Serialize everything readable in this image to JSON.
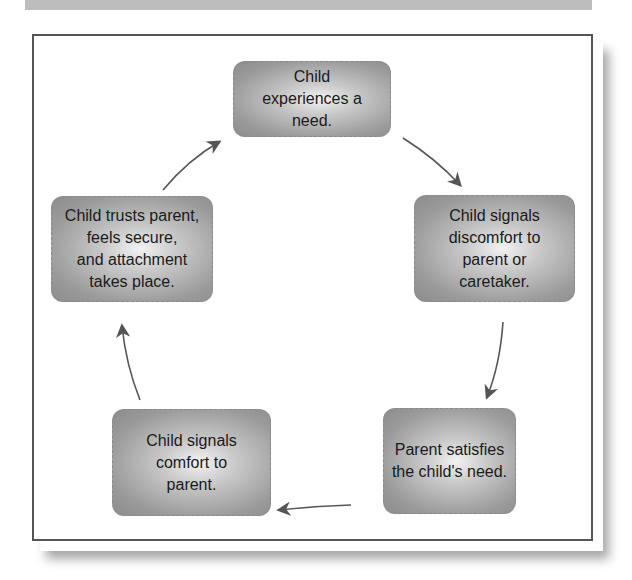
{
  "diagram": {
    "type": "cycle",
    "nodes": [
      {
        "id": "need",
        "label": "Child\nexperiences a\nneed."
      },
      {
        "id": "signal-discomfort",
        "label": "Child signals\ndiscomfort to\nparent or\ncaretaker."
      },
      {
        "id": "parent-satisfies",
        "label": "Parent satisfies\nthe child's need."
      },
      {
        "id": "signal-comfort",
        "label": "Child signals\ncomfort to\nparent."
      },
      {
        "id": "attachment",
        "label": "Child trusts parent,\nfeels secure,\nand attachment\ntakes place."
      }
    ],
    "edges": [
      {
        "from": "need",
        "to": "signal-discomfort"
      },
      {
        "from": "signal-discomfort",
        "to": "parent-satisfies"
      },
      {
        "from": "parent-satisfies",
        "to": "signal-comfort"
      },
      {
        "from": "signal-comfort",
        "to": "attachment"
      },
      {
        "from": "attachment",
        "to": "need"
      }
    ]
  },
  "colors": {
    "frame_border": "#555555",
    "box_fill_dark": "#8c8c8c",
    "box_fill_light": "#f2f2f2",
    "arrow": "#555555",
    "top_band": "#bdbdbd"
  }
}
